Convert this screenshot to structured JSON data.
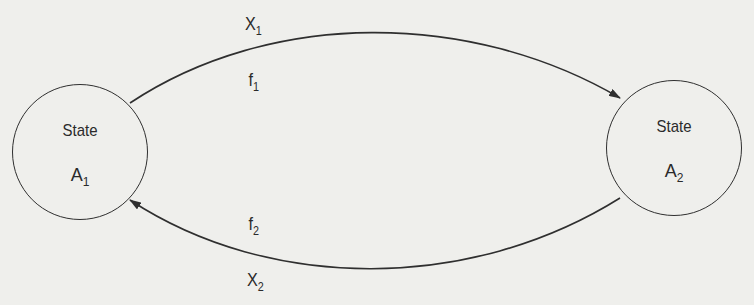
{
  "diagram": {
    "type": "state-transition",
    "nodes": [
      {
        "id": "A1",
        "title": "State",
        "name": "A",
        "subscript": "1"
      },
      {
        "id": "A2",
        "title": "State",
        "name": "A",
        "subscript": "2"
      }
    ],
    "edges": [
      {
        "from": "A1",
        "to": "A2",
        "outer_label": {
          "base": "X",
          "subscript": "1"
        },
        "inner_label": {
          "base": "f",
          "subscript": "1"
        }
      },
      {
        "from": "A2",
        "to": "A1",
        "inner_label": {
          "base": "f",
          "subscript": "2"
        },
        "outer_label": {
          "base": "X",
          "subscript": "2"
        }
      }
    ]
  },
  "colors": {
    "background": "#efefec",
    "stroke": "#2f2f2f",
    "text": "#2a2a2a"
  }
}
